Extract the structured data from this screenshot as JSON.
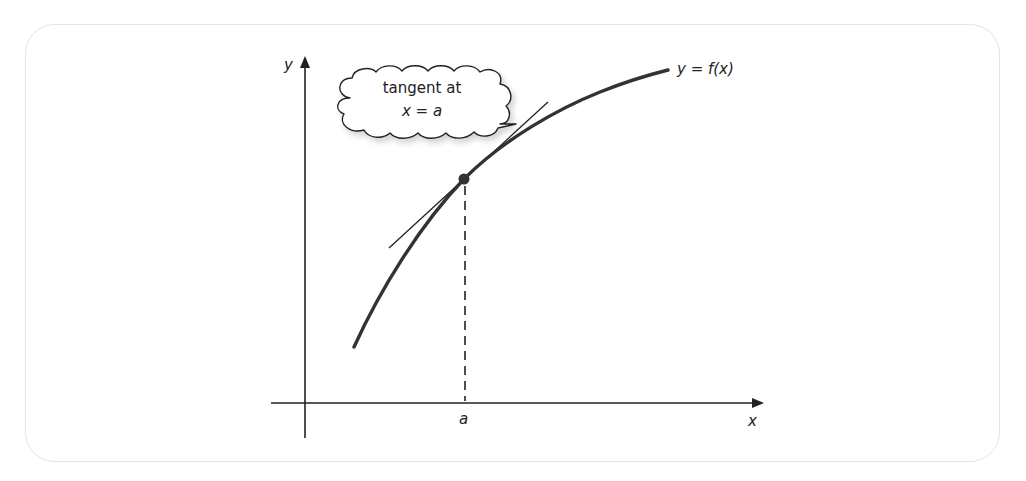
{
  "diagram": {
    "axes": {
      "x_label": "x",
      "y_label": "y"
    },
    "curve": {
      "label": "y = f(x)",
      "color": "#333333"
    },
    "point": {
      "x_label": "a",
      "color": "#333333"
    },
    "tangent": {
      "color": "#222222"
    },
    "callout": {
      "line1": "tangent at",
      "line2": "x = a"
    },
    "frame_border_color": "#e4e4e4"
  }
}
